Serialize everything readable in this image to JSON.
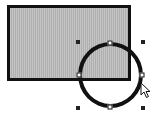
{
  "canvas": {
    "background": "#ffffff",
    "shapes": [
      {
        "type": "rectangle",
        "fill": "#b9b9b9",
        "stroke": "#111111",
        "selected": false
      },
      {
        "type": "ellipse",
        "fill": "none",
        "stroke": "#111111",
        "selected": true
      }
    ],
    "selection": {
      "corner_handles": 4,
      "point_handles": 4
    },
    "cursor": "arrow-cursor-icon"
  }
}
